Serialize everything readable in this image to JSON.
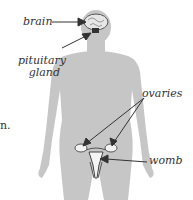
{
  "diagram": {
    "labels": {
      "brain": "brain",
      "pituitary_line1": "pituitary",
      "pituitary_line2": "gland",
      "ovaries": "ovaries",
      "womb": "womb"
    },
    "cutoff_text": "n.",
    "colors": {
      "body": "#c8c8c8",
      "arrow": "#333333",
      "text": "#333333"
    }
  }
}
